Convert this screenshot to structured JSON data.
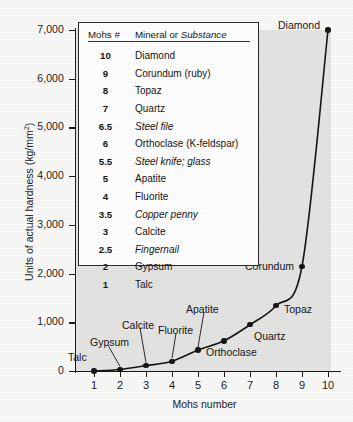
{
  "chart_data": {
    "type": "line",
    "title": "",
    "xlabel": "Mohs number",
    "ylabel": "Units of actual hardness (kg/mm²)",
    "xlim": [
      0.3,
      10.6
    ],
    "ylim": [
      0,
      7300
    ],
    "grid": false,
    "legend_position": "inside-upper-left",
    "x": [
      1,
      2,
      3,
      4,
      5,
      6,
      7,
      8,
      9,
      10
    ],
    "values": [
      1,
      32,
      110,
      200,
      430,
      620,
      950,
      1340,
      2150,
      7000
    ],
    "categories": [
      "Talc",
      "Gypsum",
      "Calcite",
      "Fluorite",
      "Apatite",
      "Orthoclase",
      "Quartz",
      "Topaz",
      "Corundum",
      "Diamond"
    ],
    "point_labels": [
      {
        "name": "Talc",
        "mohs": 1,
        "hardness": 1
      },
      {
        "name": "Gypsum",
        "mohs": 2,
        "hardness": 32
      },
      {
        "name": "Calcite",
        "mohs": 3,
        "hardness": 110
      },
      {
        "name": "Fluorite",
        "mohs": 4,
        "hardness": 200
      },
      {
        "name": "Apatite",
        "mohs": 5,
        "hardness": 430
      },
      {
        "name": "Orthoclase",
        "mohs": 6,
        "hardness": 620
      },
      {
        "name": "Quartz",
        "mohs": 7,
        "hardness": 950
      },
      {
        "name": "Topaz",
        "mohs": 8,
        "hardness": 1340
      },
      {
        "name": "Corundum",
        "mohs": 9,
        "hardness": 2150
      },
      {
        "name": "Diamond",
        "mohs": 10,
        "hardness": 7000
      }
    ],
    "y_ticks": [
      "0",
      "1,000",
      "2,000",
      "3,000",
      "4,000",
      "5,000",
      "6,000",
      "7,000"
    ],
    "y_tick_values": [
      0,
      1000,
      2000,
      3000,
      4000,
      5000,
      6000,
      7000
    ],
    "x_ticks": [
      "1",
      "2",
      "3",
      "4",
      "5",
      "6",
      "7",
      "8",
      "9",
      "10"
    ],
    "x_tick_values": [
      1,
      2,
      3,
      4,
      5,
      6,
      7,
      8,
      9,
      10
    ]
  },
  "legend_table": {
    "header": {
      "col1": "Mohs #",
      "col2_plain": "Mineral or ",
      "col2_italic": "Substance"
    },
    "rows": [
      {
        "mohs": "10",
        "name": "Diamond",
        "italic": false
      },
      {
        "mohs": "9",
        "name": "Corundum (ruby)",
        "italic": false
      },
      {
        "mohs": "8",
        "name": "Topaz",
        "italic": false
      },
      {
        "mohs": "7",
        "name": "Quartz",
        "italic": false
      },
      {
        "mohs": "6.5",
        "name": "Steel file",
        "italic": true
      },
      {
        "mohs": "6",
        "name": "Orthoclase (K-feldspar)",
        "italic": false
      },
      {
        "mohs": "5.5",
        "name": "Steel knife; glass",
        "italic": true
      },
      {
        "mohs": "5",
        "name": "Apatite",
        "italic": false
      },
      {
        "mohs": "4",
        "name": "Fluorite",
        "italic": false
      },
      {
        "mohs": "3.5",
        "name": "Copper penny",
        "italic": true
      },
      {
        "mohs": "3",
        "name": "Calcite",
        "italic": false
      },
      {
        "mohs": "2.5",
        "name": "Fingernail",
        "italic": true
      },
      {
        "mohs": "2",
        "name": "Gypsum",
        "italic": false
      },
      {
        "mohs": "1",
        "name": "Talc",
        "italic": false
      }
    ]
  },
  "colors": {
    "plot_background": "#e2e2e1",
    "page_background": "#f7f7f6",
    "axis": "#1a1a1a",
    "curve": "#151515",
    "marker": "#151515",
    "table_background": "#fdfdfd",
    "table_border": "#2a2a2a"
  }
}
